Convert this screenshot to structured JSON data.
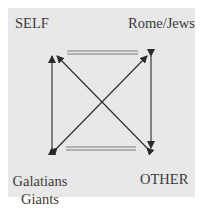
{
  "diagram": {
    "labels": {
      "top_left": "SELF",
      "top_right": "Rome/Jews",
      "bottom_left_line1": "Galatians",
      "bottom_left_line2": "Giants",
      "bottom_right": "OTHER"
    },
    "edges": [
      {
        "from": "bottom_left",
        "to": "top_left",
        "type": "arrow"
      },
      {
        "from": "top_right",
        "to": "bottom_left",
        "type": "arrow"
      },
      {
        "from": "bottom_right",
        "to": "top_left",
        "type": "arrow"
      },
      {
        "from": "top_right",
        "to": "bottom_left",
        "type": "arrow"
      },
      {
        "from": "top_left",
        "to": "top_right",
        "type": "double-line"
      },
      {
        "from": "bottom_left",
        "to": "bottom_right",
        "type": "double-line"
      }
    ],
    "colors": {
      "background": "#e8e8e8",
      "line": "#2a2a2a",
      "double_line": "#7a7a7a",
      "text": "#3a3a3a"
    }
  }
}
